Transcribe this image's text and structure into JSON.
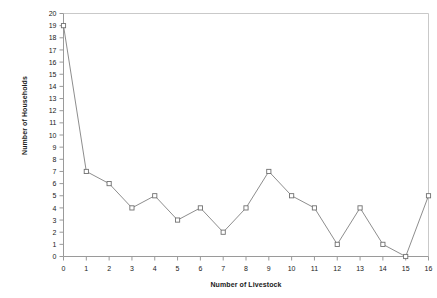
{
  "chart_data": {
    "type": "line",
    "title": "",
    "xlabel": "Number of Livestock",
    "ylabel": "Number of Households",
    "x": [
      0,
      1,
      2,
      3,
      4,
      5,
      6,
      7,
      8,
      9,
      10,
      11,
      12,
      13,
      14,
      15,
      16
    ],
    "values": [
      19,
      7,
      6,
      4,
      5,
      3,
      4,
      2,
      4,
      7,
      5,
      4,
      1,
      4,
      1,
      0,
      5
    ],
    "xlim": [
      0,
      16
    ],
    "ylim": [
      0,
      20
    ],
    "xticks": [
      "0",
      "1",
      "2",
      "3",
      "4",
      "5",
      "6",
      "7",
      "8",
      "9",
      "10",
      "11",
      "12",
      "13",
      "14",
      "15",
      "16"
    ],
    "yticks": [
      "0",
      "1",
      "2",
      "3",
      "4",
      "5",
      "6",
      "7",
      "8",
      "9",
      "10",
      "11",
      "12",
      "13",
      "14",
      "15",
      "16",
      "17",
      "18",
      "19",
      "20"
    ],
    "grid": false,
    "legend": false,
    "marker": "open-square",
    "line_color": "#808080",
    "marker_color": "#707070",
    "axis_color": "#9a9a9a"
  },
  "axes": {
    "x_title": "Number of Livestock",
    "y_title": "Number of Households"
  }
}
